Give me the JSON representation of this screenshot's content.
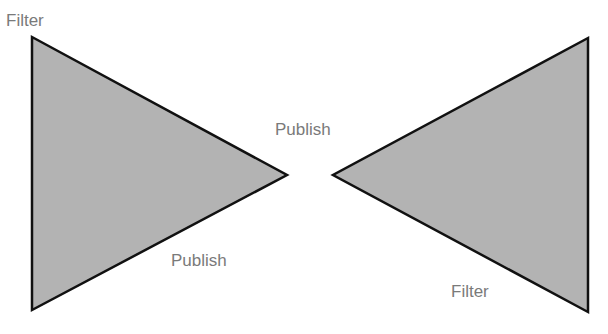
{
  "diagram": {
    "colors": {
      "fill": "#b3b3b3",
      "stroke": "#111111",
      "label": "#7a7a7a",
      "background": "#ffffff"
    },
    "shapes": [
      {
        "id": "left-triangle",
        "type": "triangle",
        "points": "32,37 287,175 32,310"
      },
      {
        "id": "right-triangle",
        "type": "triangle",
        "points": "588,38 333,175 588,312"
      }
    ],
    "labels": {
      "top_left": "Filter",
      "center_top": "Publish",
      "left_bottom": "Publish",
      "right_bottom": "Filter"
    }
  }
}
